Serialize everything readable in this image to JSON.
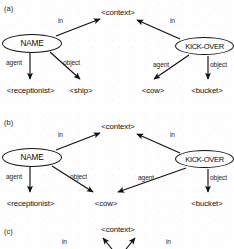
{
  "figure": {
    "background_color": "#fefefe",
    "ink_color": "#111111",
    "panels": [
      {
        "tag": "(a)",
        "context_node": "<context>",
        "left_concept": "NAME",
        "right_concept": "KICK-OVER",
        "left_in_label": "in",
        "right_in_label": "in",
        "left_agent_label": "agent",
        "left_object_label": "object",
        "right_agent_label": "agent",
        "right_object_label": "object",
        "left_agent_target": "<receptionist>",
        "left_object_target": "<ship>",
        "right_agent_target": "<cow>",
        "right_object_target": "<bucket>"
      },
      {
        "tag": "(b)",
        "context_node": "<context>",
        "left_concept": "NAME",
        "right_concept": "KICK-OVER",
        "left_in_label": "in",
        "right_in_label": "in",
        "left_agent_label": "agent",
        "left_object_label": "object",
        "right_agent_label": "agent",
        "right_object_label": "object",
        "left_agent_target": "<receptionist>",
        "left_object_target": "<cow>",
        "right_agent_target": "<cow>",
        "right_object_target": "<bucket>"
      },
      {
        "tag": "(c)",
        "context_node": "<context>",
        "left_in_label": "in",
        "right_in_label": "in"
      }
    ]
  }
}
